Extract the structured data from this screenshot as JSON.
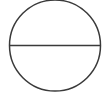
{
  "canvas": {
    "width": 109,
    "height": 103,
    "background_color": "#ffffff",
    "description": "Line drawing of a circle divided by a horizontal diameter"
  },
  "figure": {
    "name": "circle-with-horizontal-diameter",
    "stroke_color": "#3a3a3a",
    "stroke_width": 1.5,
    "fill": "none",
    "shapes": [
      {
        "id": "circle",
        "type": "circle",
        "label": "circle-outline",
        "cx": 55,
        "cy": 45.5,
        "r": 45.5,
        "bounds": {
          "left": 9.5,
          "top": 0,
          "right": 100.5,
          "bottom": 91
        }
      },
      {
        "id": "diameter",
        "type": "line",
        "label": "horizontal-diameter-line",
        "x1": 9.5,
        "y1": 45.5,
        "x2": 100.5,
        "y2": 45.5
      }
    ]
  }
}
